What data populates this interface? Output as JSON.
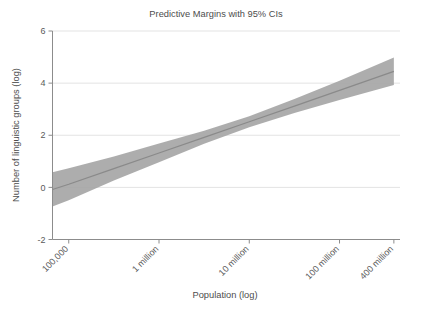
{
  "chart_data": {
    "type": "line",
    "title": "Predictive Margins with 95% CIs",
    "xlabel": "Population (log)",
    "ylabel": "Number of linguistic groups (log)",
    "grid": true,
    "legend": false,
    "xlim_log10": [
      4.82,
      8.67
    ],
    "ylim": [
      -2,
      6
    ],
    "yticks": [
      -2,
      0,
      2,
      4,
      6
    ],
    "ytick_labels": [
      "-2",
      "0",
      "2",
      "4",
      "6"
    ],
    "xticks_log10": [
      5,
      6,
      7,
      8,
      8.602
    ],
    "xtick_labels": [
      "100,000",
      "1 million",
      "10 million",
      "100 million",
      "400 million"
    ],
    "xtick_rotation_deg": -45,
    "series": [
      {
        "name": "Predicted number of linguistic groups (log)",
        "x_log10": [
          4.82,
          5.0,
          5.5,
          6.0,
          6.5,
          7.0,
          7.5,
          8.0,
          8.602
        ],
        "values": [
          -0.08,
          0.12,
          0.72,
          1.32,
          1.92,
          2.52,
          3.12,
          3.72,
          4.45
        ],
        "ci_lower": [
          -0.73,
          -0.49,
          0.26,
          0.96,
          1.67,
          2.31,
          2.85,
          3.35,
          3.93
        ],
        "ci_upper": [
          0.58,
          0.73,
          1.18,
          1.68,
          2.17,
          2.73,
          3.39,
          4.09,
          4.98
        ],
        "ci_level": "95%"
      }
    ],
    "colors": {
      "line": "#8a8a8a",
      "ci_band": "#a6a6a6",
      "grid": "#e3e3e3",
      "axis": "#8c8c8c",
      "text": "#4d4d4d"
    }
  }
}
